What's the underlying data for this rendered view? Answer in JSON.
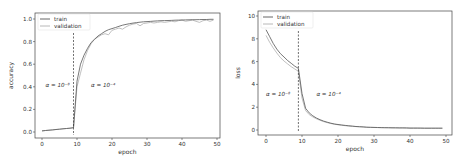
{
  "chart_data": [
    {
      "type": "line",
      "title": "",
      "xlabel": "epoch",
      "ylabel": "accuracy",
      "xlim": [
        -2,
        51
      ],
      "ylim": [
        -0.05,
        1.05
      ],
      "xticks": [
        "0",
        "10",
        "20",
        "30",
        "40",
        "50"
      ],
      "yticks": [
        "0.0",
        "0.2",
        "0.4",
        "0.6",
        "0.8",
        "1.0"
      ],
      "grid": false,
      "legend_position": "upper left",
      "annotations": [
        {
          "text": "α = 10⁻⁸",
          "x": 1,
          "y": 0.42
        },
        {
          "text": "α = 10⁻⁴",
          "x": 14,
          "y": 0.42
        },
        {
          "type": "vline",
          "x": 9,
          "style": "dashed"
        }
      ],
      "x": [
        0,
        1,
        2,
        3,
        4,
        5,
        6,
        7,
        8,
        9,
        10,
        11,
        12,
        13,
        14,
        15,
        16,
        17,
        18,
        19,
        20,
        21,
        22,
        23,
        24,
        25,
        26,
        27,
        28,
        29,
        30,
        31,
        32,
        33,
        34,
        35,
        36,
        37,
        38,
        39,
        40,
        41,
        42,
        43,
        44,
        45,
        46,
        47,
        48,
        49
      ],
      "series": [
        {
          "name": "train",
          "color": "#555555",
          "values": [
            0.01,
            0.013,
            0.016,
            0.019,
            0.022,
            0.025,
            0.028,
            0.031,
            0.034,
            0.038,
            0.45,
            0.6,
            0.68,
            0.74,
            0.79,
            0.82,
            0.85,
            0.87,
            0.89,
            0.905,
            0.915,
            0.925,
            0.935,
            0.945,
            0.952,
            0.958,
            0.964,
            0.968,
            0.972,
            0.975,
            0.977,
            0.979,
            0.981,
            0.983,
            0.985,
            0.986,
            0.987,
            0.988,
            0.989,
            0.99,
            0.991,
            0.992,
            0.993,
            0.994,
            0.994,
            0.995,
            0.996,
            0.996,
            0.997,
            0.997
          ]
        },
        {
          "name": "validation",
          "color": "#b0b0b0",
          "values": [
            0.01,
            0.013,
            0.016,
            0.019,
            0.022,
            0.025,
            0.028,
            0.031,
            0.034,
            0.038,
            0.4,
            0.52,
            0.64,
            0.72,
            0.78,
            0.82,
            0.84,
            0.86,
            0.87,
            0.86,
            0.9,
            0.91,
            0.92,
            0.91,
            0.93,
            0.945,
            0.955,
            0.96,
            0.94,
            0.96,
            0.965,
            0.97,
            0.965,
            0.97,
            0.975,
            0.97,
            0.975,
            0.98,
            0.975,
            0.985,
            0.99,
            0.98,
            0.985,
            0.99,
            0.98,
            0.97,
            0.985,
            0.99,
            0.98,
            0.99
          ]
        }
      ]
    },
    {
      "type": "line",
      "title": "",
      "xlabel": "epoch",
      "ylabel": "loss",
      "xlim": [
        -2,
        51
      ],
      "ylim": [
        -0.3,
        10.5
      ],
      "xticks": [
        "0",
        "10",
        "20",
        "30",
        "40",
        "50"
      ],
      "yticks": [
        "0",
        "2",
        "4",
        "6",
        "8",
        "10"
      ],
      "grid": false,
      "legend_position": "upper left",
      "annotations": [
        {
          "text": "α = 10⁻⁸",
          "x": 0,
          "y": 3.2
        },
        {
          "text": "α = 10⁻⁴",
          "x": 14,
          "y": 3.2
        },
        {
          "type": "vline",
          "x": 9,
          "style": "dashed"
        }
      ],
      "x": [
        0,
        1,
        2,
        3,
        4,
        5,
        6,
        7,
        8,
        9,
        10,
        11,
        12,
        13,
        14,
        15,
        16,
        17,
        18,
        19,
        20,
        21,
        22,
        23,
        24,
        25,
        26,
        27,
        28,
        29,
        30,
        31,
        32,
        33,
        34,
        35,
        36,
        37,
        38,
        39,
        40,
        41,
        42,
        43,
        44,
        45,
        46,
        47,
        48,
        49
      ],
      "series": [
        {
          "name": "train",
          "color": "#555555",
          "values": [
            8.8,
            8.2,
            7.6,
            7.1,
            6.7,
            6.4,
            6.1,
            5.85,
            5.6,
            5.4,
            3.2,
            1.9,
            1.5,
            1.25,
            1.05,
            0.9,
            0.78,
            0.68,
            0.6,
            0.53,
            0.48,
            0.44,
            0.4,
            0.37,
            0.34,
            0.31,
            0.29,
            0.27,
            0.25,
            0.24,
            0.23,
            0.22,
            0.21,
            0.2,
            0.2,
            0.19,
            0.19,
            0.18,
            0.18,
            0.18,
            0.17,
            0.17,
            0.17,
            0.17,
            0.16,
            0.16,
            0.16,
            0.16,
            0.16,
            0.16
          ]
        },
        {
          "name": "validation",
          "color": "#b0b0b0",
          "values": [
            8.3,
            7.7,
            7.2,
            6.75,
            6.35,
            6.05,
            5.8,
            5.55,
            5.35,
            5.15,
            2.8,
            1.7,
            1.35,
            1.15,
            0.98,
            0.85,
            0.74,
            0.65,
            0.57,
            0.51,
            0.46,
            0.42,
            0.38,
            0.35,
            0.32,
            0.3,
            0.28,
            0.26,
            0.24,
            0.23,
            0.22,
            0.21,
            0.2,
            0.2,
            0.19,
            0.19,
            0.18,
            0.18,
            0.18,
            0.17,
            0.17,
            0.17,
            0.17,
            0.16,
            0.16,
            0.16,
            0.16,
            0.16,
            0.16,
            0.16
          ]
        }
      ]
    }
  ]
}
